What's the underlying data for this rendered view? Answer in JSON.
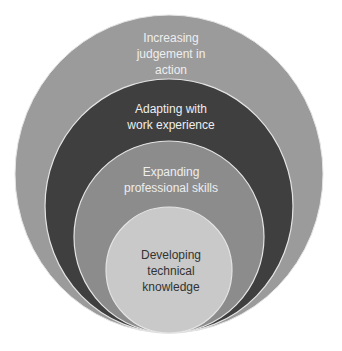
{
  "diagram": {
    "type": "nested-circles",
    "colors": {
      "outer": "#9b9b9b",
      "second": "#3f3f3f",
      "third": "#8c8c8c",
      "inner": "#c9c9c9",
      "border": "#e4e4e4",
      "light_text": "#eeeeee",
      "dark_text": "#333333"
    },
    "rings": [
      {
        "label": "Increasing\njudgement in\naction"
      },
      {
        "label": "Adapting with\nwork experience"
      },
      {
        "label": "Expanding\nprofessional skills"
      },
      {
        "label": "Developing\ntechnical\nknowledge"
      }
    ]
  }
}
